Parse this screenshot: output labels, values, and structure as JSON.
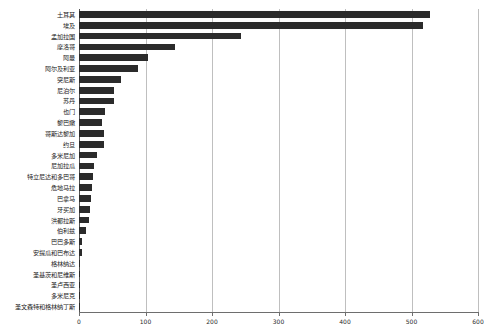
{
  "chart_data": {
    "type": "bar",
    "orientation": "horizontal",
    "title": "",
    "subtitle": "",
    "xlabel": "",
    "ylabel": "",
    "xlim": [
      0,
      600
    ],
    "ylim": null,
    "grid": true,
    "legend": null,
    "xticks": [
      0,
      100,
      200,
      300,
      400,
      500,
      600
    ],
    "xtick_labels": [
      "0",
      "100",
      "200",
      "300",
      "400",
      "500",
      "600"
    ],
    "bar_color": "#2b2b2b",
    "gridline_color": "#bfbfbf",
    "axis_color": "#6e6e6e",
    "categories": [
      "土耳其",
      "埃及",
      "孟加拉国",
      "摩洛哥",
      "阿曼",
      "阿尔及利亚",
      "突尼斯",
      "尼泊尔",
      "苏丹",
      "也门",
      "黎巴嫩",
      "哥斯达黎加",
      "约旦",
      "多米尼加",
      "尼加拉瓜",
      "特立尼达和多巴哥",
      "危地马拉",
      "巴拿马",
      "牙买加",
      "洪都拉斯",
      "伯利兹",
      "巴巴多斯",
      "安提瓜和巴布达",
      "格林纳达",
      "圣基茨和尼维斯",
      "圣卢西亚",
      "多米尼克",
      "圣文森特和格林纳丁斯"
    ],
    "values": [
      528,
      517,
      244,
      144,
      104,
      89,
      63,
      53,
      53,
      39,
      35,
      38,
      38,
      27,
      23,
      21,
      19,
      18,
      17,
      15,
      11,
      5,
      4,
      2,
      2,
      1,
      1,
      1
    ]
  }
}
